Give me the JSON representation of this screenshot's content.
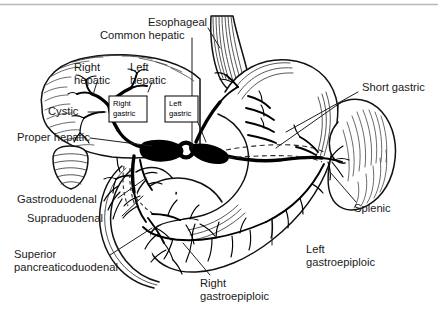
{
  "figure": {
    "width": 438,
    "height": 322,
    "background": "#ffffff",
    "ink_color": "#000000",
    "leader_color": "#1d1d1d",
    "rule_color": "#b9b9bd"
  },
  "labels": {
    "esophageal": "Esophageal",
    "common_hepatic": "Common hepatic",
    "right_hepatic_l1": "Right",
    "right_hepatic_l2": "hepatic",
    "left_hepatic_l1": "Left",
    "left_hepatic_l2": "hepatic",
    "cystic": "Cystic",
    "proper_hepatic": "Proper hepatic",
    "right_gastric_l1": "Right",
    "right_gastric_l2": "gastric",
    "left_gastric_l1": "Left",
    "left_gastric_l2": "gastric",
    "short_gastric": "Short gastric",
    "splenic": "Splenic",
    "gastroduodenal": "Gastroduodenal",
    "supraduodenal": "Supraduodenal",
    "superior_pancreaticoduodenal_l1": "Superior",
    "superior_pancreaticoduodenal_l2": "pancreaticoduodenal",
    "right_gastroepiploic_l1": "Right",
    "right_gastroepiploic_l2": "gastroepiploic",
    "left_gastroepiploic_l1": "Left",
    "left_gastroepiploic_l2": "gastroepiploic"
  },
  "structures": [
    {
      "name": "liver",
      "side": "left",
      "shading": "hatched-margin"
    },
    {
      "name": "stomach",
      "side": "center",
      "shading": "outline"
    },
    {
      "name": "esophagus",
      "side": "top-center",
      "shading": "longitudinal-striations"
    },
    {
      "name": "spleen",
      "side": "right",
      "shading": "hatched"
    },
    {
      "name": "duodenum",
      "side": "lower-left",
      "shading": "outline"
    },
    {
      "name": "pancreas",
      "side": "lower-center",
      "shading": "outline"
    },
    {
      "name": "aorta",
      "side": "center",
      "shading": "ring-cross-section"
    },
    {
      "name": "gallbladder",
      "side": "upper-left",
      "shading": "striped"
    }
  ]
}
